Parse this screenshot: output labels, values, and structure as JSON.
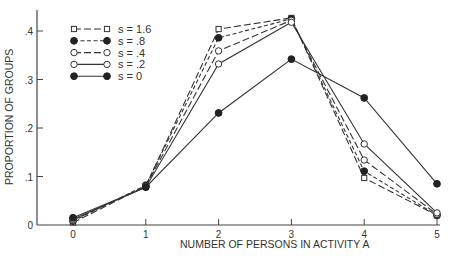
{
  "chart_data": {
    "type": "line",
    "title": "",
    "xlabel": "NUMBER OF PERSONS IN ACTIVITY  A",
    "ylabel": "PROPORTION OF GROUPS",
    "x": [
      0,
      1,
      2,
      3,
      4,
      5
    ],
    "xticks": [
      "0",
      "1",
      "2",
      "3",
      "4",
      "5"
    ],
    "yticks": [
      "0",
      ".1",
      ".2",
      ".3",
      ".4"
    ],
    "ytick_values": [
      0,
      0.1,
      0.2,
      0.3,
      0.4
    ],
    "xlim": [
      0,
      5
    ],
    "ylim": [
      0,
      0.44
    ],
    "grid": false,
    "legend_position": "upper left",
    "series": [
      {
        "name": "s = 1.6",
        "marker": "open-square",
        "line": "long-dash",
        "values": [
          0.005,
          0.08,
          0.404,
          0.427,
          0.097,
          0.02
        ]
      },
      {
        "name": "s = .8",
        "marker": "filled-circle",
        "line": "short-dash",
        "values": [
          0.008,
          0.082,
          0.386,
          0.425,
          0.111,
          0.02
        ]
      },
      {
        "name": "s = .4",
        "marker": "open-circle",
        "line": "long-dash",
        "values": [
          0.01,
          0.08,
          0.359,
          0.422,
          0.134,
          0.022
        ]
      },
      {
        "name": "s = .2",
        "marker": "open-circle",
        "line": "solid",
        "values": [
          0.012,
          0.078,
          0.332,
          0.418,
          0.167,
          0.025
        ]
      },
      {
        "name": "s =  0",
        "marker": "filled-circle",
        "line": "solid",
        "values": [
          0.015,
          0.078,
          0.231,
          0.342,
          0.262,
          0.085
        ]
      }
    ]
  }
}
